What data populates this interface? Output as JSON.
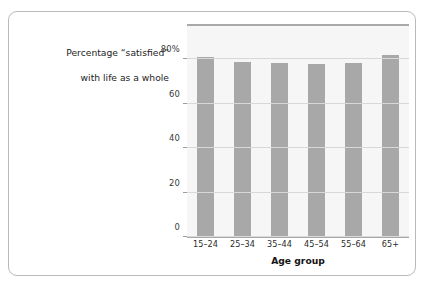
{
  "chart_data": {
    "type": "bar",
    "title": "Percentage “satisfied” with life as a whole",
    "title_lines": [
      "Percentage “satisfied”",
      "with life as a whole"
    ],
    "xlabel": "Age group",
    "ylabel": "",
    "categories": [
      "15–24",
      "25–34",
      "35–44",
      "45–54",
      "55–64",
      "65+"
    ],
    "values": [
      81,
      79,
      78.5,
      78,
      78.5,
      82
    ],
    "ylim": [
      0,
      95
    ],
    "yticks": [
      0,
      20,
      40,
      60,
      80
    ],
    "ytick_labels": [
      "0",
      "20",
      "40",
      "60",
      "80%"
    ],
    "grid": true,
    "legend": "none",
    "bar_color": "#a8a8a8",
    "plot_background": "#f6f6f6",
    "axis_color": "#a9a9a9",
    "gridline_color": "#d8d8d8"
  },
  "card": {
    "border_color": "#b9b9b9",
    "background": "#ffffff"
  }
}
